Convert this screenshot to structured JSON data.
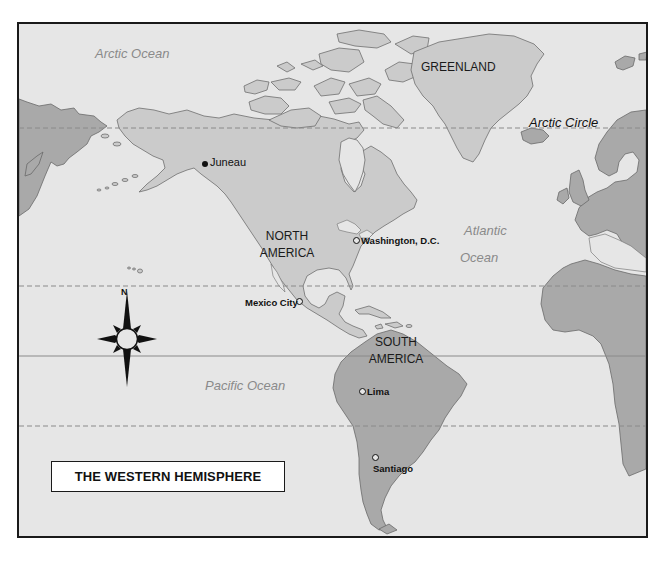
{
  "map": {
    "title": "THE WESTERN HEMISPHERE",
    "colors": {
      "ocean": "#e6e6e6",
      "north_america": "#cbcbcb",
      "other_land": "#a9a9a9",
      "frame": "#1a1a1a"
    },
    "oceans": [
      {
        "id": "arctic",
        "label": "Arctic Ocean"
      },
      {
        "id": "atlantic",
        "label_line1": "Atlantic",
        "label_line2": "Ocean"
      },
      {
        "id": "pacific",
        "label": "Pacific Ocean"
      }
    ],
    "regions": [
      {
        "id": "greenland",
        "label": "GREENLAND"
      },
      {
        "id": "north-america",
        "label_line1": "NORTH",
        "label_line2": "AMERICA"
      },
      {
        "id": "south-america",
        "label_line1": "SOUTH",
        "label_line2": "AMERICA"
      }
    ],
    "cities": [
      {
        "id": "juneau",
        "label": "Juneau",
        "marker": "solid"
      },
      {
        "id": "washington",
        "label": "Washington, D.C.",
        "marker": "open"
      },
      {
        "id": "mexico-city",
        "label": "Mexico City",
        "marker": "open"
      },
      {
        "id": "lima",
        "label": "Lima",
        "marker": "open"
      },
      {
        "id": "santiago",
        "label": "Santiago",
        "marker": "open"
      }
    ],
    "latitude_lines": [
      {
        "id": "arctic-circle",
        "label": "Arctic Circle",
        "style": "dashed"
      },
      {
        "id": "tropic-of-cancer",
        "label": "",
        "style": "dashed"
      },
      {
        "id": "equator",
        "label": "",
        "style": "solid"
      },
      {
        "id": "tropic-of-capricorn",
        "label": "",
        "style": "dashed"
      }
    ],
    "compass": {
      "north_label": "N"
    }
  }
}
